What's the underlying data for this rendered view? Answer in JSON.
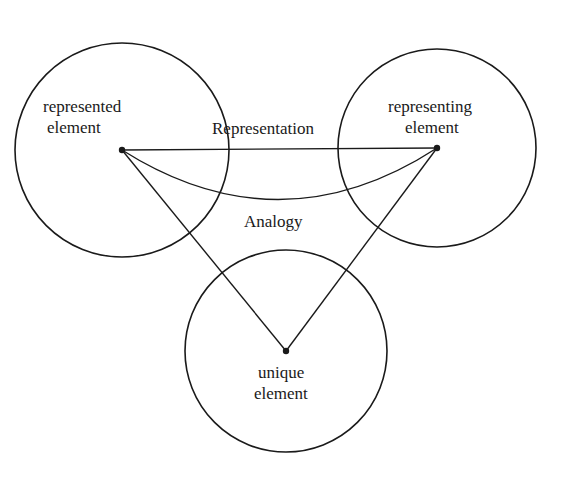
{
  "diagram": {
    "nodes": {
      "represented": {
        "line1": "represented",
        "line2": "element"
      },
      "representing": {
        "line1": "representing",
        "line2": "element"
      },
      "unique": {
        "line1": "unique",
        "line2": "element"
      }
    },
    "edges": {
      "representation": "Representation",
      "analogy": "Analogy"
    },
    "colors": {
      "stroke": "#1a1a1a",
      "background": "#ffffff"
    }
  }
}
